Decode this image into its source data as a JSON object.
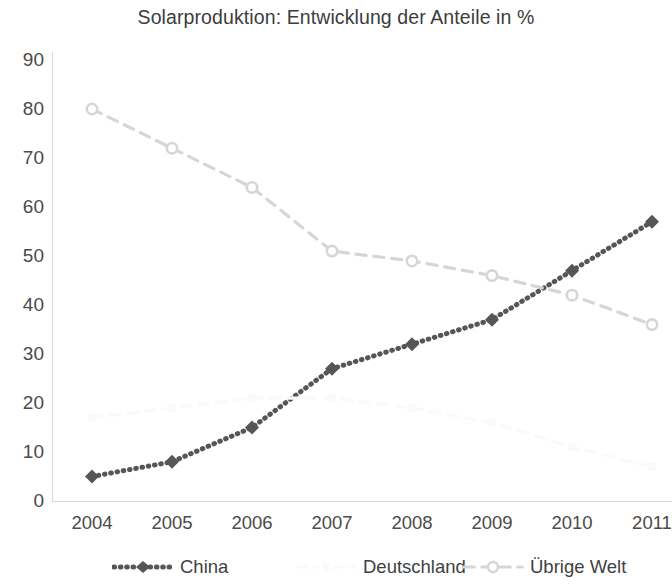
{
  "chart_data": {
    "type": "line",
    "title": "Solarproduktion: Entwicklung der Anteile in %",
    "xlabel": "",
    "ylabel": "",
    "categories": [
      "2004",
      "2005",
      "2006",
      "2007",
      "2008",
      "2009",
      "2010",
      "2011"
    ],
    "ylim": [
      0,
      90
    ],
    "y_ticks": [
      "0",
      "10",
      "20",
      "30",
      "40",
      "50",
      "60",
      "70",
      "80",
      "90"
    ],
    "grid": false,
    "legend_position": "bottom",
    "series": [
      {
        "name": "China",
        "values": [
          5,
          8,
          15,
          27,
          32,
          37,
          47,
          57
        ],
        "color": "#565656",
        "line_style": "dotted",
        "marker": "diamond"
      },
      {
        "name": "Deutschland",
        "values": [
          17,
          19,
          21,
          21,
          19,
          16,
          11,
          7
        ],
        "color": "#fafafa",
        "line_style": "dashed",
        "marker": "square"
      },
      {
        "name": "Übrige Welt",
        "values": [
          80,
          72,
          64,
          51,
          49,
          46,
          42,
          36
        ],
        "color": "#d6d6d6",
        "line_style": "dashed",
        "marker": "circle"
      }
    ]
  },
  "legend": {
    "items": [
      {
        "label": "China"
      },
      {
        "label": "Deutschland"
      },
      {
        "label": "Übrige Welt"
      }
    ]
  },
  "colors": {
    "title_text": "#3d3d3d",
    "tick_text": "#4a4a4a",
    "china": "#565656",
    "deutschland": "#fafafa",
    "uebrige_welt": "#d6d6d6",
    "background": "#ffffff"
  }
}
